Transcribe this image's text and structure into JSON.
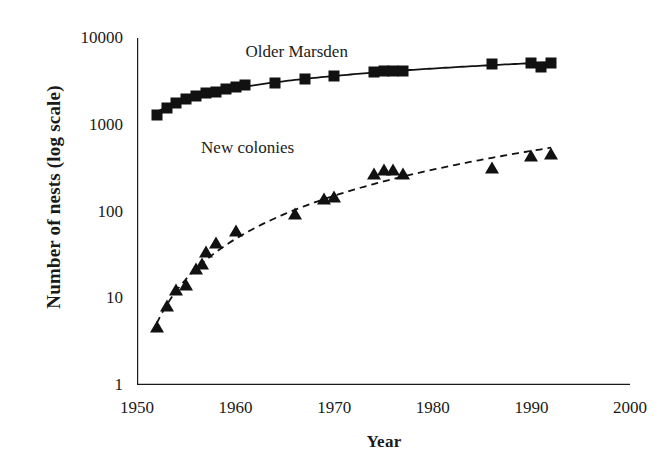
{
  "chart_data": {
    "type": "scatter",
    "title": "",
    "xlabel": "Year",
    "ylabel": "Number of nests (log scale)",
    "xlim": [
      1950,
      2000
    ],
    "ylim": [
      1,
      10000
    ],
    "yscale": "log",
    "grid": false,
    "legend_position": "inline-annotations",
    "xticks": [
      "1950",
      "1960",
      "1970",
      "1980",
      "1990",
      "2000"
    ],
    "xtick_values": [
      1950,
      1960,
      1970,
      1980,
      1990,
      2000
    ],
    "yticks": [
      "1",
      "10",
      "100",
      "1000",
      "10000"
    ],
    "ytick_values": [
      1,
      10,
      100,
      1000,
      10000
    ],
    "series": [
      {
        "name": "Older Marsden",
        "marker": "filled-square",
        "line": "solid",
        "color": "#111111",
        "annotation": "Older Marsden",
        "points": [
          {
            "x": 1952,
            "y": 1300
          },
          {
            "x": 1953,
            "y": 1550
          },
          {
            "x": 1954,
            "y": 1800
          },
          {
            "x": 1955,
            "y": 2000
          },
          {
            "x": 1956,
            "y": 2150
          },
          {
            "x": 1957,
            "y": 2300
          },
          {
            "x": 1958,
            "y": 2400
          },
          {
            "x": 1959,
            "y": 2550
          },
          {
            "x": 1960,
            "y": 2700
          },
          {
            "x": 1961,
            "y": 2850
          },
          {
            "x": 1964,
            "y": 3000
          },
          {
            "x": 1967,
            "y": 3400
          },
          {
            "x": 1970,
            "y": 3600
          },
          {
            "x": 1974,
            "y": 4100
          },
          {
            "x": 1975,
            "y": 4200
          },
          {
            "x": 1976,
            "y": 4200
          },
          {
            "x": 1977,
            "y": 4200
          },
          {
            "x": 1986,
            "y": 5000
          },
          {
            "x": 1990,
            "y": 5200
          },
          {
            "x": 1991,
            "y": 4600
          },
          {
            "x": 1992,
            "y": 5200
          }
        ]
      },
      {
        "name": "New colonies",
        "marker": "filled-triangle",
        "line": "dashed",
        "color": "#111111",
        "annotation": "New colonies",
        "points": [
          {
            "x": 1952,
            "y": 4.5
          },
          {
            "x": 1953,
            "y": 8
          },
          {
            "x": 1954,
            "y": 12
          },
          {
            "x": 1955,
            "y": 14
          },
          {
            "x": 1956,
            "y": 21
          },
          {
            "x": 1956.6,
            "y": 24
          },
          {
            "x": 1957,
            "y": 33
          },
          {
            "x": 1958,
            "y": 42
          },
          {
            "x": 1960,
            "y": 58
          },
          {
            "x": 1966,
            "y": 90
          },
          {
            "x": 1969,
            "y": 135
          },
          {
            "x": 1970,
            "y": 145
          },
          {
            "x": 1974,
            "y": 265
          },
          {
            "x": 1975,
            "y": 290
          },
          {
            "x": 1976,
            "y": 290
          },
          {
            "x": 1977,
            "y": 265
          },
          {
            "x": 1986,
            "y": 310
          },
          {
            "x": 1990,
            "y": 430
          },
          {
            "x": 1992,
            "y": 450
          }
        ]
      }
    ]
  }
}
